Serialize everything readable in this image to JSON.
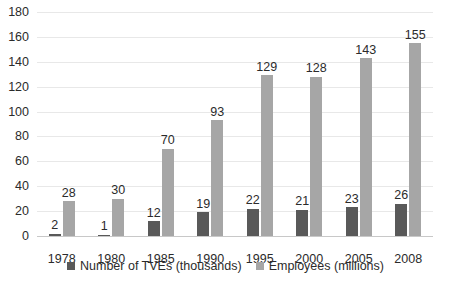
{
  "chart_data": {
    "type": "bar",
    "title": "",
    "subtitle": "",
    "xlabel": "",
    "ylabel": "",
    "categories": [
      "1978",
      "1980",
      "1985",
      "1990",
      "1995",
      "2000",
      "2005",
      "2008"
    ],
    "series": [
      {
        "name": "Number of TVEs (thousands)",
        "color": "#595959",
        "values": [
          2,
          1,
          12,
          19,
          22,
          21,
          23,
          26
        ]
      },
      {
        "name": "Employees (millions)",
        "color": "#a6a6a6",
        "values": [
          28,
          30,
          70,
          93,
          129,
          128,
          143,
          155
        ]
      }
    ],
    "ylim": [
      0,
      180
    ],
    "ytick_step": 20,
    "yticks": [
      "0",
      "20",
      "40",
      "60",
      "80",
      "100",
      "120",
      "140",
      "160",
      "180"
    ],
    "grid": true,
    "data_labels": true,
    "legend_position": "bottom"
  },
  "colors": {
    "background": "#ffffff",
    "gridline": "#e8e8e8",
    "axis": "#c8c8c8",
    "text": "#2b2b2b",
    "series0": "#595959",
    "series1": "#a6a6a6"
  }
}
